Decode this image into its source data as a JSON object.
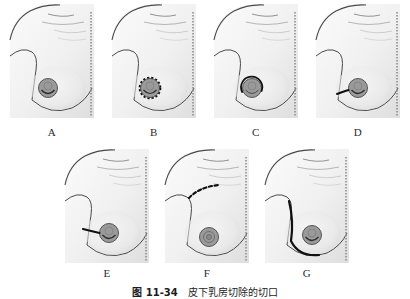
{
  "figure": {
    "caption_number": "图 11-34",
    "caption_text": "皮下乳房切除的切口",
    "panel_count": 7,
    "colors": {
      "skin_light": "#f4f4f4",
      "skin_shade": "#dcdcdc",
      "outline": "#3a3a3a",
      "areola_fill": "#9a9a9a",
      "areola_stroke": "#555555",
      "incision": "#1a1a1a",
      "midline_ruler": "#8e8e8e",
      "label_text": "#2b2b2b"
    }
  },
  "panels": [
    {
      "label": "A",
      "row": "top",
      "marking": "none",
      "marking_name": "intact-breast-no-incision",
      "areola": "solid-filled"
    },
    {
      "label": "B",
      "row": "top",
      "marking": "circumareolar-dashed-circle",
      "marking_name": "periareolar-circular-incision",
      "areola": "solid-filled"
    },
    {
      "label": "C",
      "row": "top",
      "marking": "semicircular-arc",
      "marking_name": "hemi-periareolar-incision",
      "areola": "solid-filled"
    },
    {
      "label": "D",
      "row": "top",
      "marking": "short-radial-line-medial",
      "marking_name": "short-radial-incision",
      "areola": "solid-filled"
    },
    {
      "label": "E",
      "row": "bottom",
      "marking": "long-radial-line-medial",
      "marking_name": "extended-radial-incision",
      "areola": "solid-filled"
    },
    {
      "label": "F",
      "row": "bottom",
      "marking": "upper-chest-dashed-curve",
      "marking_name": "axillary-dashed-incision",
      "areola": "solid-filled"
    },
    {
      "label": "G",
      "row": "bottom",
      "marking": "lateral-chest-wall-curve",
      "marking_name": "inframammary-lateral-incision",
      "areola": "solid-filled"
    }
  ]
}
